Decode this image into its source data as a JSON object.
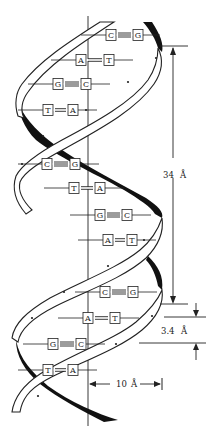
{
  "diagram": {
    "colors": {
      "ink": "#222222",
      "background": "#ffffff",
      "strand_back": "#111111",
      "strand_front": "#ffffff"
    },
    "base_pairs": [
      {
        "left": "C",
        "right": "G",
        "bonds": 3,
        "y": 35,
        "lx": 111,
        "rx": 138
      },
      {
        "left": "A",
        "right": "T",
        "bonds": 2,
        "y": 60,
        "lx": 81,
        "rx": 109
      },
      {
        "left": "G",
        "right": "C",
        "bonds": 3,
        "y": 84,
        "lx": 58,
        "rx": 86
      },
      {
        "left": "T",
        "right": "A",
        "bonds": 2,
        "y": 110,
        "lx": 48,
        "rx": 73
      },
      {
        "left": "C",
        "right": "G",
        "bonds": 3,
        "y": 164,
        "lx": 47,
        "rx": 75
      },
      {
        "left": "T",
        "right": "A",
        "bonds": 2,
        "y": 188,
        "lx": 74,
        "rx": 100
      },
      {
        "left": "G",
        "right": "C",
        "bonds": 3,
        "y": 215,
        "lx": 100,
        "rx": 127
      },
      {
        "left": "A",
        "right": "T",
        "bonds": 2,
        "y": 240,
        "lx": 108,
        "rx": 132
      },
      {
        "left": "C",
        "right": "G",
        "bonds": 3,
        "y": 292,
        "lx": 105,
        "rx": 133
      },
      {
        "left": "A",
        "right": "T",
        "bonds": 2,
        "y": 318,
        "lx": 88,
        "rx": 115
      },
      {
        "left": "G",
        "right": "C",
        "bonds": 3,
        "y": 344,
        "lx": 53,
        "rx": 81
      },
      {
        "left": "T",
        "right": "A",
        "bonds": 2,
        "y": 370,
        "lx": 48,
        "rx": 73
      }
    ],
    "dimensions": {
      "pitch_label": "34 Å",
      "pitch_number": "34",
      "rise_label": "3.4 Å",
      "rise_number": "3.4",
      "radius_label": "10 Å",
      "radius_number": "10",
      "angstrom": "Å"
    }
  }
}
